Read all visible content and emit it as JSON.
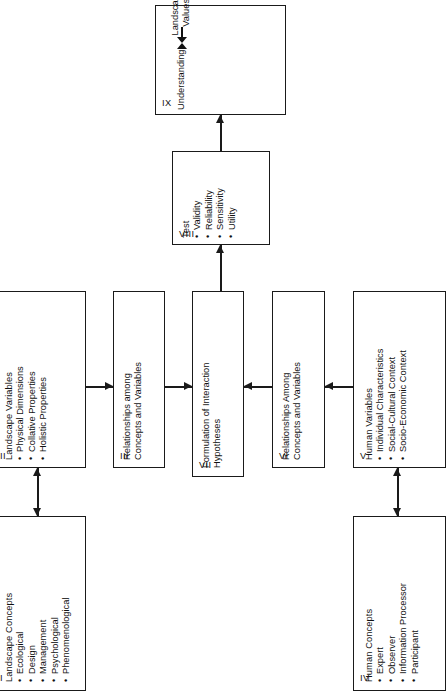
{
  "diagram": {
    "orientation": "rotated-90-ccw",
    "line_color": "#1a1a1a",
    "background": "#ffffff",
    "nodes": {
      "i": {
        "numeral": "I",
        "title": "Landscape Concepts",
        "bullets": [
          "Ecological",
          "Design",
          "Management",
          "Psychological",
          "Phenomenological"
        ]
      },
      "ii": {
        "numeral": "II",
        "title": "Landscape Variables",
        "bullets": [
          "Physical Dimensions",
          "Collative Properties",
          "Holistic Properties"
        ]
      },
      "iii": {
        "numeral": "III",
        "line1": "Relationships among",
        "line2": "Concepts and Variables"
      },
      "iv": {
        "numeral": "IV",
        "title": "Human Concepts",
        "bullets": [
          "Expert",
          "Observer",
          "Information Processor",
          "Participant"
        ]
      },
      "v": {
        "numeral": "V",
        "title": "Human Variables",
        "bullets": [
          "Individual Characteristics",
          "Social-Cultural Context",
          "Socio-Economic Context"
        ]
      },
      "vi": {
        "numeral": "VI",
        "line1": "Relationships Among",
        "line2": "Concepts and Variables"
      },
      "vii": {
        "numeral": "VII",
        "line1": "Formulation of Interaction",
        "line2": "Hypotheses"
      },
      "viii": {
        "numeral": "VIII",
        "title": "Test",
        "bullets": [
          "Validity",
          "Reliability",
          "Sensitivity",
          "Utility"
        ]
      },
      "ix": {
        "numeral": "IX",
        "left_label": "Understanding",
        "center_label_line1": "Landscape",
        "center_label_line2": "Values",
        "right_label": "Application"
      }
    },
    "connectors": [
      {
        "name": "i-to-ii",
        "from": "I",
        "to": "II",
        "style": "double-headed"
      },
      {
        "name": "ii-to-iii",
        "from": "II",
        "to": "III",
        "style": "single-headed"
      },
      {
        "name": "iii-to-vii",
        "from": "III",
        "to": "VII",
        "style": "single-headed"
      },
      {
        "name": "iv-to-v",
        "from": "IV",
        "to": "V",
        "style": "double-headed"
      },
      {
        "name": "v-to-vi",
        "from": "V",
        "to": "VI",
        "style": "single-headed"
      },
      {
        "name": "vi-to-vii",
        "from": "VI",
        "to": "VII",
        "style": "single-headed"
      },
      {
        "name": "vii-to-viii",
        "from": "VII",
        "to": "VIII",
        "style": "single-headed"
      },
      {
        "name": "viii-to-ix",
        "from": "VIII",
        "to": "IX",
        "style": "single-headed"
      }
    ]
  }
}
